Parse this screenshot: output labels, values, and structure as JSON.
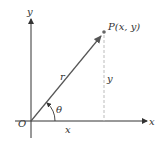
{
  "diagram": {
    "type": "polar-coordinates",
    "labels": {
      "y_axis": "y",
      "x_axis": "x",
      "origin": "O",
      "point_letter": "P",
      "point_coords": "(x, y)",
      "radius": "r",
      "vertical_leg": "y",
      "horizontal_leg": "x",
      "angle": "θ"
    },
    "colors": {
      "axis": "#333333",
      "radius_vector": "#555555",
      "point": "#666666",
      "dashed_line": "#bbbbbb",
      "text": "#333333"
    }
  }
}
